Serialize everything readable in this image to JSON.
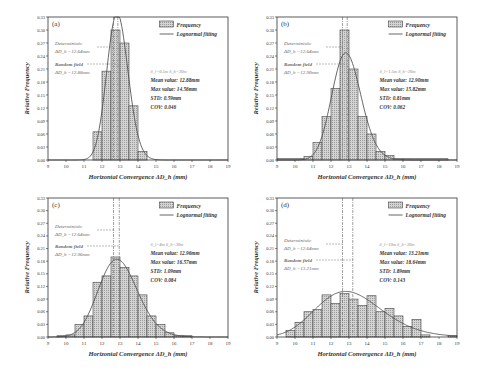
{
  "chart_data": [
    {
      "panel": "(a)",
      "type": "bar",
      "title": "",
      "xlabel": "Horizontal Convergence ΔD_h (mm)",
      "ylabel": "Relative Frequency",
      "xlim": [
        9,
        19
      ],
      "ylim": [
        0,
        0.33
      ],
      "xticks": [
        9,
        10,
        11,
        12,
        13,
        14,
        15,
        16,
        17,
        18,
        19
      ],
      "yticks": [
        "0.00",
        "0.03",
        "0.06",
        "0.09",
        "0.12",
        "0.15",
        "0.18",
        "0.21",
        "0.24",
        "0.27",
        "0.30",
        "0.33"
      ],
      "legend": [
        "Frequency",
        "Lognormal fitting"
      ],
      "bin_edges": [
        11.5,
        12.0,
        12.5,
        13.0,
        13.5,
        14.0,
        14.5
      ],
      "values": [
        0.065,
        0.205,
        0.3,
        0.27,
        0.125,
        0.02
      ],
      "fit": {
        "type": "lognormal",
        "mean": 12.88,
        "std": 0.59
      },
      "deterministic_line": 12.64,
      "random_field_line": 12.88,
      "annotations": {
        "det_label": "Deterministic",
        "det_value": "ΔD_h =12.64mm",
        "rf_label": "Random field",
        "rf_value": "ΔD_h =12.88mm",
        "params": "δ_l=0.5m   δ_h=30m",
        "mean": "Mean value: 12.88mm",
        "max": "Max value: 14.56mm",
        "std": "STD: 0.59mm",
        "cov": "COV: 0.046"
      }
    },
    {
      "panel": "(b)",
      "type": "bar",
      "xlabel": "Horizontal Convergence ΔD_h (mm)",
      "ylabel": "Relative Frequency",
      "xlim": [
        9,
        19
      ],
      "ylim": [
        0,
        0.33
      ],
      "xticks": [
        9,
        10,
        11,
        12,
        13,
        14,
        15,
        16,
        17,
        18,
        19
      ],
      "yticks": [
        "0.00",
        "0.03",
        "0.06",
        "0.09",
        "0.12",
        "0.15",
        "0.18",
        "0.21",
        "0.24",
        "0.27",
        "0.30",
        "0.33"
      ],
      "legend": [
        "Frequency",
        "Lognormal fitting"
      ],
      "bin_edges": [
        9.0,
        10.5,
        11.0,
        11.5,
        12.0,
        12.5,
        13.0,
        13.5,
        14.0,
        14.5,
        15.0,
        15.5,
        16.0,
        18.5
      ],
      "values": [
        0.003,
        0.008,
        0.04,
        0.1,
        0.165,
        0.3,
        0.21,
        0.1,
        0.06,
        0.02,
        0.01,
        0.003,
        0.003
      ],
      "fit": {
        "type": "lognormal",
        "mean": 12.9,
        "std": 0.81
      },
      "deterministic_line": 12.64,
      "random_field_line": 12.9,
      "annotations": {
        "det_label": "Deterministic",
        "det_value": "ΔD_h =12.64mm",
        "rf_label": "Random field",
        "rf_value": "ΔD_h =12.90mm",
        "params": "δ_l=1.5m   δ_h=30m",
        "mean": "Mean value: 12.90mm",
        "max": "Max value: 15.82mm",
        "std": "STD: 0.81mm",
        "cov": "COV: 0.062"
      }
    },
    {
      "panel": "(c)",
      "type": "bar",
      "xlabel": "Horizontal Convergence ΔD_h (mm)",
      "ylabel": "Relative Frequency",
      "xlim": [
        9,
        19
      ],
      "ylim": [
        0,
        0.33
      ],
      "xticks": [
        9,
        10,
        11,
        12,
        13,
        14,
        15,
        16,
        17,
        18,
        19
      ],
      "yticks": [
        "0.00",
        "0.03",
        "0.06",
        "0.09",
        "0.12",
        "0.15",
        "0.18",
        "0.21",
        "0.24",
        "0.27",
        "0.30",
        "0.33"
      ],
      "legend": [
        "Frequency",
        "Lognormal fitting"
      ],
      "bin_edges": [
        9.5,
        10.0,
        10.5,
        11.0,
        11.5,
        12.0,
        12.5,
        13.0,
        13.5,
        14.0,
        14.5,
        15.0,
        15.5,
        16.0,
        16.5,
        17.0
      ],
      "values": [
        0.003,
        0.005,
        0.03,
        0.05,
        0.13,
        0.145,
        0.19,
        0.165,
        0.145,
        0.1,
        0.05,
        0.03,
        0.01,
        0.003,
        0.003
      ],
      "fit": {
        "type": "lognormal",
        "mean": 12.96,
        "std": 1.09
      },
      "deterministic_line": 12.64,
      "random_field_line": 12.96,
      "annotations": {
        "det_label": "Deterministic",
        "det_value": "ΔD_h =12.64mm",
        "rf_label": "Random field",
        "rf_value": "ΔD_h =12.96mm",
        "params": "δ_l=4m   δ_h=30m",
        "mean": "Mean value: 12.96mm",
        "max": "Max value: 16.57mm",
        "std": "STD: 1.09mm",
        "cov": "COV: 0.084"
      }
    },
    {
      "panel": "(d)",
      "type": "bar",
      "xlabel": "Horizontal Convergence ΔD_h (mm)",
      "ylabel": "Relative Frequency",
      "xlim": [
        9,
        19
      ],
      "ylim": [
        0,
        0.33
      ],
      "xticks": [
        9,
        10,
        11,
        12,
        13,
        14,
        15,
        16,
        17,
        18,
        19
      ],
      "yticks": [
        "0.00",
        "0.03",
        "0.06",
        "0.09",
        "0.12",
        "0.15",
        "0.18",
        "0.21",
        "0.24",
        "0.27",
        "0.30",
        "0.33"
      ],
      "legend": [
        "Frequency",
        "Lognormal fitting"
      ],
      "bin_edges": [
        9.5,
        10.0,
        10.5,
        11.0,
        11.5,
        12.0,
        12.5,
        13.0,
        13.5,
        14.0,
        14.5,
        15.0,
        15.5,
        16.0,
        16.5,
        17.0,
        17.5,
        18.5,
        19.0
      ],
      "values": [
        0.015,
        0.035,
        0.06,
        0.065,
        0.1,
        0.08,
        0.103,
        0.09,
        0.075,
        0.098,
        0.06,
        0.068,
        0.05,
        0.025,
        0.042,
        0.005,
        0.0,
        0.003
      ],
      "fit": {
        "type": "lognormal",
        "mean": 13.21,
        "std": 1.89
      },
      "deterministic_line": 12.64,
      "random_field_line": 13.21,
      "annotations": {
        "det_label": "Deterministic",
        "det_value": "ΔD_h =12.64mm",
        "rf_label": "Random field",
        "rf_value": "ΔD_h =13.21mm",
        "params": "δ_l=10m   δ_h=30m",
        "mean": "Mean value: 13.21mm",
        "max": "Max value: 18.64mm",
        "std": "STD: 1.89mm",
        "cov": "COV: 0.143"
      }
    }
  ]
}
